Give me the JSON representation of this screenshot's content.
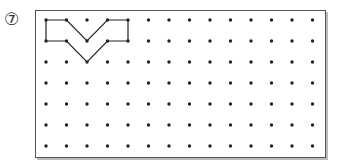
{
  "problem": {
    "number_label": "⑦"
  },
  "grid": {
    "cols": 14,
    "rows": 7,
    "origin_x": 46,
    "origin_y": 20,
    "spacing_x": 20.5,
    "spacing_y": 21,
    "dot_color": "#222"
  },
  "shape": {
    "stroke": "#222",
    "points": [
      [
        0,
        0
      ],
      [
        1,
        0
      ],
      [
        2,
        1
      ],
      [
        3,
        0
      ],
      [
        4,
        0
      ],
      [
        4,
        1
      ],
      [
        3,
        1
      ],
      [
        2,
        2
      ],
      [
        1,
        1
      ],
      [
        0,
        1
      ]
    ]
  }
}
